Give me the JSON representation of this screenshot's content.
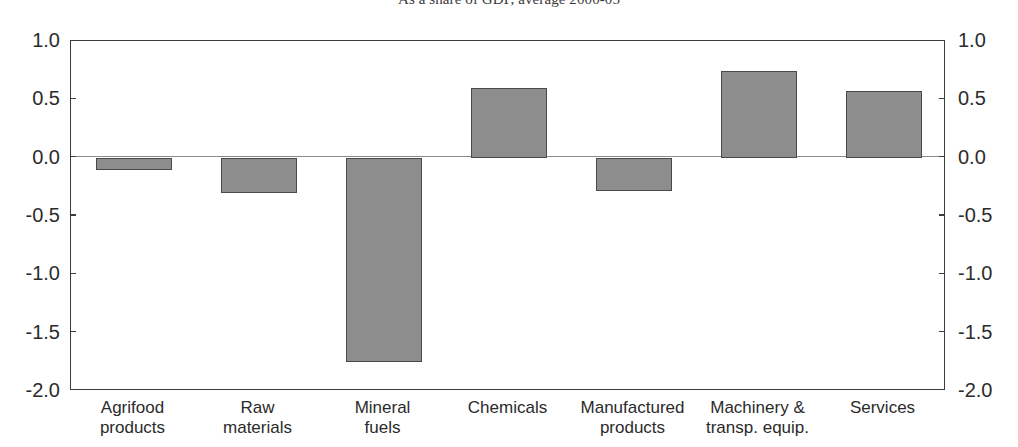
{
  "chart_data": {
    "type": "bar",
    "title": "As a share of GDP, average 2000-05",
    "xlabel": "",
    "ylabel": "",
    "ylim": [
      -2.0,
      1.0
    ],
    "yticks": [
      "1.0",
      "0.5",
      "0.0",
      "-0.5",
      "-1.0",
      "-1.5",
      "-2.0"
    ],
    "ytick_values": [
      1.0,
      0.5,
      0.0,
      -0.5,
      -1.0,
      -1.5,
      -2.0
    ],
    "grid": false,
    "legend": "none",
    "dual_y_axis": true,
    "zero_line": true,
    "bar_color": "#8d8d8d",
    "bar_edge_color": "#4a4a4a",
    "categories": [
      "Agrifood\nproducts",
      "Raw\nmaterials",
      "Mineral\nfuels",
      "Chemicals",
      "Manufactured\nproducts",
      "Machinery &\ntransp. equip.",
      "Services"
    ],
    "category_lines": [
      [
        "Agrifood",
        "products"
      ],
      [
        "Raw",
        "materials"
      ],
      [
        "Mineral",
        "fuels"
      ],
      [
        "Chemicals",
        ""
      ],
      [
        "Manufactured",
        "products"
      ],
      [
        "Machinery &",
        "transp. equip."
      ],
      [
        "Services",
        ""
      ]
    ],
    "values": [
      -0.11,
      -0.3,
      -1.75,
      0.6,
      -0.29,
      0.74,
      0.57
    ]
  }
}
